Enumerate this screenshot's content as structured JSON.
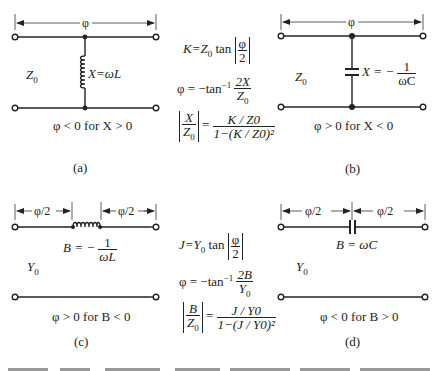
{
  "figure": {
    "panels": [
      {
        "id": "a",
        "label": "(a)",
        "line_label": "Z0",
        "line_label_main": "Z",
        "line_label_sub": "0",
        "span_label": "φ",
        "element": "shunt-inductor",
        "element_label": "X=ωL",
        "condition": "φ < 0 for X > 0"
      },
      {
        "id": "b",
        "label": "(b)",
        "line_label": "Z0",
        "line_label_main": "Z",
        "line_label_sub": "0",
        "span_label": "φ",
        "element": "shunt-capacitor",
        "element_label_lhs": "X = −",
        "element_label_num": "1",
        "element_label_den": "ωC",
        "condition": "φ > 0 for X < 0"
      },
      {
        "id": "c",
        "label": "(c)",
        "line_label": "Y0",
        "line_label_main": "Y",
        "line_label_sub": "0",
        "span_label_left": "φ/2",
        "span_label_right": "φ/2",
        "element": "series-inductor",
        "element_label_lhs": "B = −",
        "element_label_num": "1",
        "element_label_den": "ωL",
        "condition": "φ > 0 for B < 0"
      },
      {
        "id": "d",
        "label": "(d)",
        "line_label": "Y0",
        "line_label_main": "Y",
        "line_label_sub": "0",
        "span_label_left": "φ/2",
        "span_label_right": "φ/2",
        "element": "series-capacitor",
        "element_label": "B = ωC",
        "condition": "φ < 0 for B > 0"
      }
    ],
    "equations_top": {
      "eq1": "K = Z0 tan |φ/2|",
      "eq1_lhs": "K=Z",
      "eq1_sub": "0",
      "eq1_tan": " tan ",
      "eq1_num": "φ",
      "eq1_den": "2",
      "eq2": "φ = −tan⁻¹ 2X/Z0",
      "eq2_lhs": "φ = −tan",
      "eq2_sup": "−1",
      "eq2_num": "2X",
      "eq2_den_main": "Z",
      "eq2_den_sub": "0",
      "eq3": "|X/Z0| = (K/Z0) / (1−(K/Z0)²)",
      "eq3_abs_num": "X",
      "eq3_abs_den_main": "Z",
      "eq3_abs_den_sub": "0",
      "eq3_eq": "=",
      "eq3_num": "K / Z0",
      "eq3_den": "1−(K / Z0)²"
    },
    "equations_bottom": {
      "eq1": "J = Y0 tan |φ/2|",
      "eq1_lhs": "J=Y",
      "eq1_sub": "0",
      "eq1_tan": " tan ",
      "eq1_num": "φ",
      "eq1_den": "2",
      "eq2": "φ = −tan⁻¹ 2B/Y0",
      "eq2_lhs": "φ = −tan",
      "eq2_sup": "−1",
      "eq2_num": "2B",
      "eq2_den_main": "Y",
      "eq2_den_sub": "0",
      "eq3": "|B/Z0| = (J/Y0) / (1−(J/Y0)²)",
      "eq3_abs_num": "B",
      "eq3_abs_den_main": "Z",
      "eq3_abs_den_sub": "0",
      "eq3_eq": "=",
      "eq3_num": "J / Y0",
      "eq3_den": "1−(J / Y0)²"
    },
    "colors": {
      "ink": "#222222",
      "background": "#ffffff"
    }
  }
}
